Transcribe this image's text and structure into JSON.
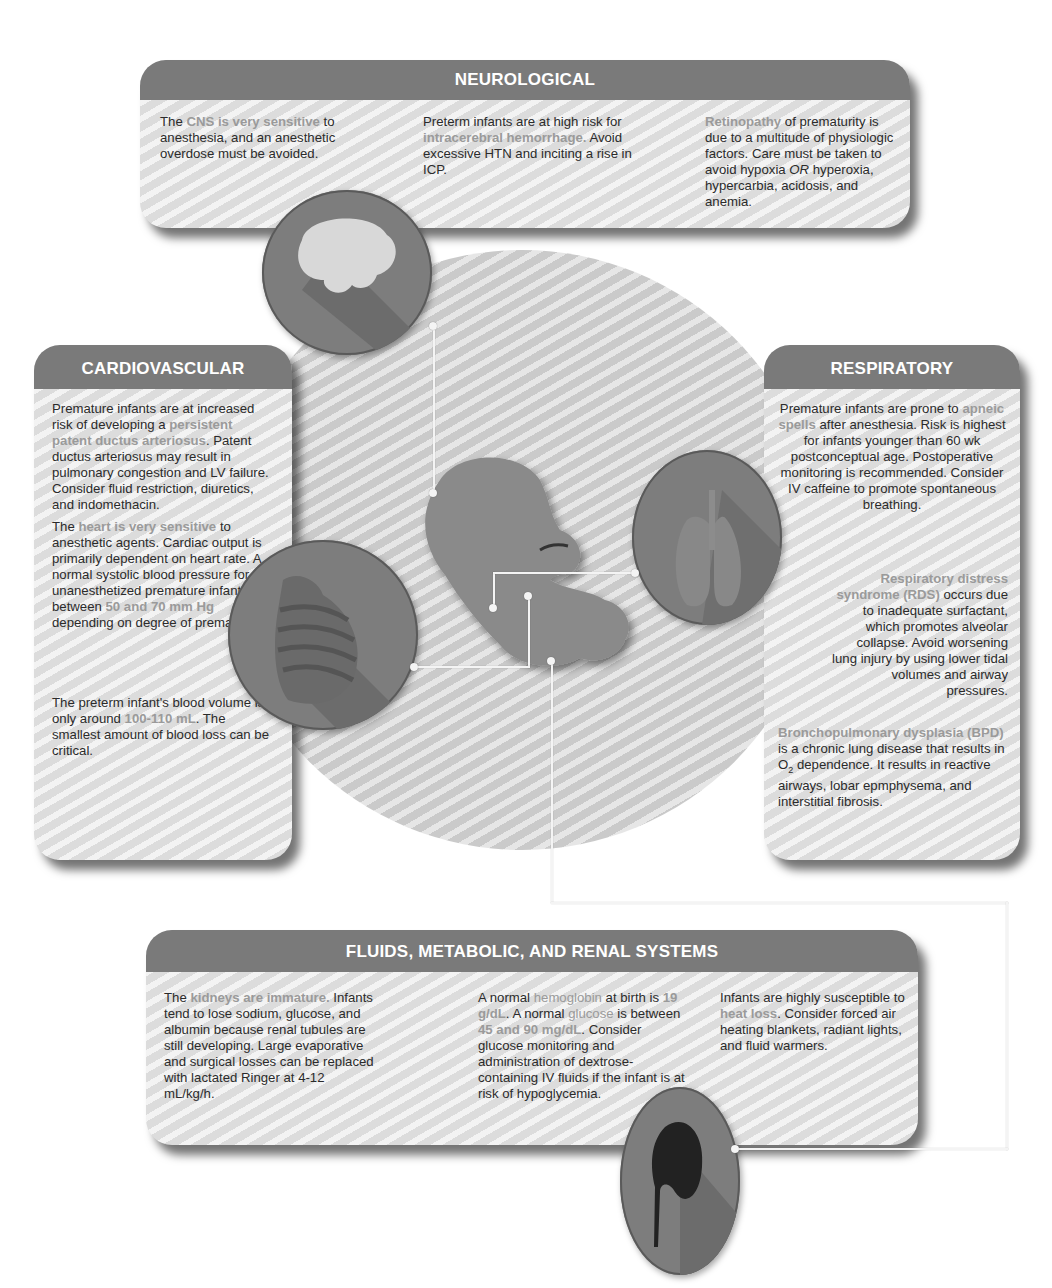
{
  "panels": {
    "neurological": {
      "title": "NEUROLOGICAL",
      "col1": {
        "t1": "The ",
        "h1": "CNS is very sensitive",
        "t2": " to anesthesia, and an anesthetic overdose must be avoided."
      },
      "col2": {
        "t1": "Preterm infants are at high risk for ",
        "h1": "intracerebral hemorrhage.",
        "t2": " Avoid excessive HTN and inciting a rise in ICP."
      },
      "col3": {
        "h1": "Retinopathy",
        "t1": " of prematurity is due to a multitude of physiologic factors. Care must be taken to avoid hypoxia ",
        "em": "OR",
        "t2": " hyperoxia, hypercarbia, acidosis, and anemia."
      }
    },
    "cardiovascular": {
      "title": "CARDIOVASCULAR",
      "p1": {
        "t1": "Premature infants are at increased risk of developing a ",
        "h1": "persistent patent ductus arteriosus",
        "t2": ". Patent ductus arteriosus may result in pulmonary congestion and LV failure. Consider fluid restriction, diuretics, and indomethacin."
      },
      "p2": {
        "t1": "The ",
        "h1": "heart is very sensitive",
        "t2": " to anesthetic agents. Cardiac output is primarily dependent on heart rate. A normal systolic blood pressure for unanesthetized premature infants is between ",
        "h2": "50 and 70 mm Hg",
        "t3": " depending on degree of prematurity."
      },
      "p3": {
        "t1": "The preterm infant's blood volume is only around ",
        "h1": "100-110 mL",
        "t2": ". The smallest amount of blood loss can be critical."
      }
    },
    "respiratory": {
      "title": "RESPIRATORY",
      "p1": {
        "t1": "Premature infants are prone to ",
        "h1": "apneic spells",
        "t2": " after anesthesia. Risk is highest for infants younger than 60 wk postconceptual age. Postoperative monitoring is recommended. Consider IV caffeine to promote spontaneous breathing."
      },
      "p2": {
        "h1": "Respiratory distress syndrome (RDS)",
        "t1": " occurs due to inadequate surfactant, which promotes alveolar collapse. Avoid worsening lung injury by using lower tidal volumes and airway pressures."
      },
      "p3": {
        "h1": "Bronchopulmonary dysplasia (BPD)",
        "t1": " is a chronic lung disease that results in O",
        "sub": "2",
        "t2": " dependence. It results in reactive airways, lobar epmphysema, and interstitial fibrosis."
      }
    },
    "fluids": {
      "title": "FLUIDS, METABOLIC, AND RENAL SYSTEMS",
      "col1": {
        "t1": "The ",
        "h1": "kidneys are immature.",
        "t2": " Infants tend to lose sodium, glucose, and albumin because renal tubules are still developing. Large evaporative and surgical losses can be replaced with lactated Ringer at 4-12 mL/kg/h."
      },
      "col2": {
        "t1": "A normal ",
        "h1": "hemoglobin",
        "t2": " at birth is ",
        "h2": "19 g/dL",
        "t3": ". A normal ",
        "h3": "glucose",
        "t4": " is between ",
        "h4": "45 and 90 mg/dL",
        "t5": ". Consider glucose monitoring and administration of dextrose-containing IV fluids if the infant is at risk of hypoglycemia."
      },
      "col3": {
        "t1": "Infants are highly susceptible to ",
        "h1": "heat loss",
        "t2": ". Consider forced air heating blankets, radiant lights, and fluid warmers."
      }
    }
  },
  "icons": {
    "brain": "brain-icon",
    "heart": "heart-icon",
    "lungs": "lungs-icon",
    "kidney": "kidney-icon",
    "fetus": "fetus-figure"
  },
  "colors": {
    "header": "#7a7a7a",
    "highlight": "#9a9a9a",
    "icon_circle": "#7d7d7d",
    "panel_bg": "#e4e4e4"
  }
}
